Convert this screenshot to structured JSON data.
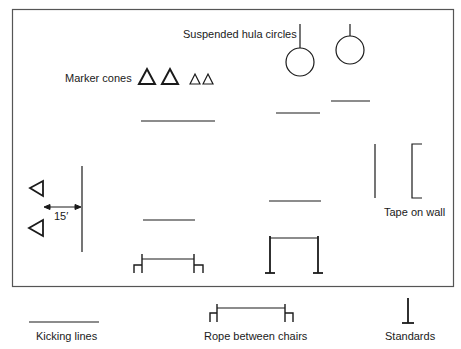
{
  "diagram": {
    "labels": {
      "suspended_hula_circles": "Suspended hula circles",
      "marker_cones": "Marker cones",
      "distance": "15′",
      "tape_on_wall": "Tape on wall"
    },
    "legend": {
      "kicking_lines": "Kicking lines",
      "rope_between_chairs": "Rope between chairs",
      "standards": "Standards"
    },
    "colors": {
      "stroke": "#1a1a1a",
      "border": "#555555",
      "background": "#ffffff"
    }
  }
}
